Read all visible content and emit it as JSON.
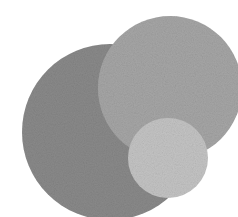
{
  "image": {
    "description": "Three overlapping textured gray circles",
    "background": "#ffffff",
    "circles": [
      {
        "name": "large",
        "cx": 110,
        "cy": 132,
        "r": 88,
        "color": "#8a8a8a"
      },
      {
        "name": "medium",
        "cx": 170,
        "cy": 88,
        "r": 72,
        "color": "#a6a6a6"
      },
      {
        "name": "small",
        "cx": 168,
        "cy": 158,
        "r": 40,
        "color": "#c4c4c4"
      }
    ]
  }
}
